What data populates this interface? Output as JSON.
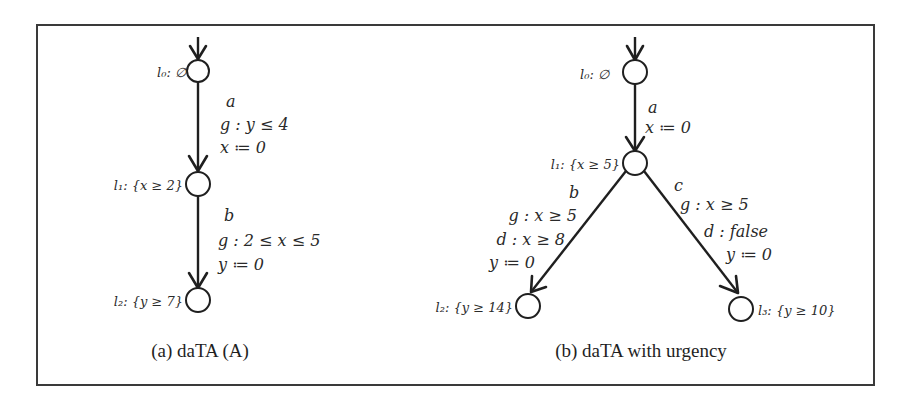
{
  "figure": {
    "panels": [
      {
        "id": "a",
        "caption": "(a) daTA (A)",
        "states": [
          {
            "id": "l0",
            "label": "l₀: ∅",
            "initial": true
          },
          {
            "id": "l1",
            "label": "l₁: {x ≥ 2}",
            "initial": false
          },
          {
            "id": "l2",
            "label": "l₂: {y ≥ 7}",
            "initial": false
          }
        ],
        "transitions": [
          {
            "from": "l0",
            "to": "l1",
            "action": "a",
            "guard": "g : y ≤ 4",
            "reset": "x ≔ 0"
          },
          {
            "from": "l1",
            "to": "l2",
            "action": "b",
            "guard": "g : 2 ≤ x ≤ 5",
            "reset": "y ≔ 0"
          }
        ]
      },
      {
        "id": "b",
        "caption": "(b) daTA with urgency",
        "states": [
          {
            "id": "l0",
            "label": "l₀: ∅",
            "initial": true
          },
          {
            "id": "l1",
            "label": "l₁: {x ≥ 5}",
            "initial": false
          },
          {
            "id": "l2",
            "label": "l₂: {y ≥ 14}",
            "initial": false
          },
          {
            "id": "l3",
            "label": "l₃: {y ≥ 10}",
            "initial": false
          }
        ],
        "transitions": [
          {
            "from": "l0",
            "to": "l1",
            "action": "a",
            "reset": "x ≔ 0"
          },
          {
            "from": "l1",
            "to": "l2",
            "action": "b",
            "guard": "g : x ≥ 5",
            "deadline": "d : x ≥ 8",
            "reset": "y ≔ 0"
          },
          {
            "from": "l1",
            "to": "l3",
            "action": "c",
            "guard": "g : x ≥ 5",
            "deadline": "d : false",
            "reset": "y ≔ 0"
          }
        ]
      }
    ]
  }
}
